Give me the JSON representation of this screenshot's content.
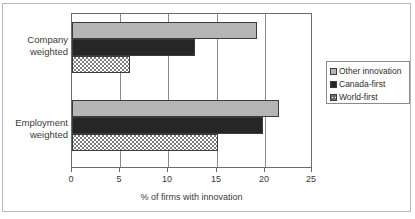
{
  "chart_data": {
    "type": "bar",
    "orientation": "horizontal",
    "title": "",
    "xlabel": "% of firms with innovation",
    "ylabel": "",
    "xlim": [
      0,
      25
    ],
    "xticks": [
      0,
      5,
      10,
      15,
      20,
      25
    ],
    "xtick_labels": [
      "0",
      "5",
      "10",
      "15",
      "20",
      "25"
    ],
    "grid": true,
    "grid_axis": "x",
    "legend_position": "right-outside",
    "categories": [
      "Company weighted",
      "Employment weighted"
    ],
    "series": [
      {
        "name": "Other innovation",
        "color": "#b5b5b5",
        "pattern": "solid-light-gray",
        "values": [
          19.4,
          21.7
        ]
      },
      {
        "name": "Canada-first",
        "color": "#262626",
        "pattern": "solid-black",
        "values": [
          12.9,
          20.0
        ]
      },
      {
        "name": "World-first",
        "color": "#ffffff",
        "pattern": "cross-hatch",
        "values": [
          6.1,
          15.3
        ]
      }
    ]
  },
  "axis": {
    "x_label": "% of firms with innovation",
    "ticks": [
      "0",
      "5",
      "10",
      "15",
      "20",
      "25"
    ]
  },
  "categories": [
    {
      "line1": "Company",
      "line2": "weighted"
    },
    {
      "line1": "Employment",
      "line2": "weighted"
    }
  ],
  "legend": {
    "entries": [
      {
        "label": "Other innovation"
      },
      {
        "label": "Canada-first"
      },
      {
        "label": "World-first"
      }
    ]
  }
}
